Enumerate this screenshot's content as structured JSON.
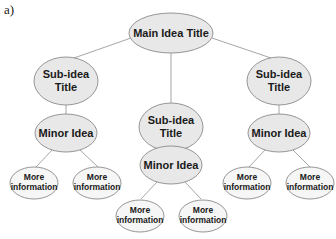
{
  "figure_label": "a)",
  "diagram": {
    "type": "concept-map",
    "main": {
      "label": "Main Idea Title"
    },
    "branches": [
      {
        "sub": {
          "line1": "Sub-idea",
          "line2": "Title"
        },
        "minor": {
          "label": "Minor Idea"
        },
        "leaves": [
          {
            "line1": "More",
            "line2": "information"
          },
          {
            "line1": "More",
            "line2": "information"
          }
        ]
      },
      {
        "sub": {
          "line1": "Sub-idea",
          "line2": "Title"
        },
        "minor": {
          "label": "Minor Idea"
        },
        "leaves": [
          {
            "line1": "More",
            "line2": "information"
          },
          {
            "line1": "More",
            "line2": "information"
          }
        ]
      },
      {
        "sub": {
          "line1": "Sub-idea",
          "line2": "Title"
        },
        "minor": {
          "label": "Minor Idea"
        },
        "leaves": [
          {
            "line1": "More",
            "line2": "information"
          },
          {
            "line1": "More",
            "line2": "information"
          }
        ]
      }
    ]
  },
  "colors": {
    "node_fill": "#e8e8e8",
    "leaf_fill": "#f6f6f6",
    "stroke": "#8a8a8a"
  }
}
